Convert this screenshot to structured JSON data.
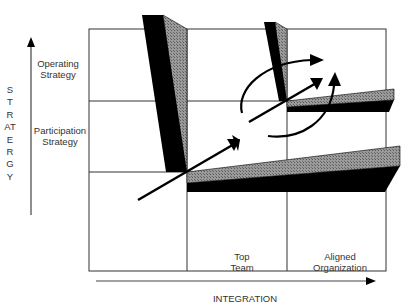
{
  "diagram": {
    "y_axis": {
      "label": "STRATERGY",
      "direction": "up"
    },
    "x_axis": {
      "label": "INTEGRATION",
      "direction": "right"
    },
    "row_labels": [
      {
        "id": "operating",
        "line1": "Operating",
        "line2": "Strategy"
      },
      {
        "id": "participation",
        "line1": "Participation",
        "line2": "Strategy"
      }
    ],
    "column_labels": [
      {
        "id": "top-team",
        "line1": "Top",
        "line2": "Team"
      },
      {
        "id": "aligned-org",
        "line1": "Aligned",
        "line2": "Organization"
      }
    ],
    "grid": {
      "columns": 3,
      "rows": 3
    },
    "colors": {
      "fill_dark": "#000000",
      "fill_hatched": "#8a8a8a",
      "grid_line": "#333333"
    }
  }
}
